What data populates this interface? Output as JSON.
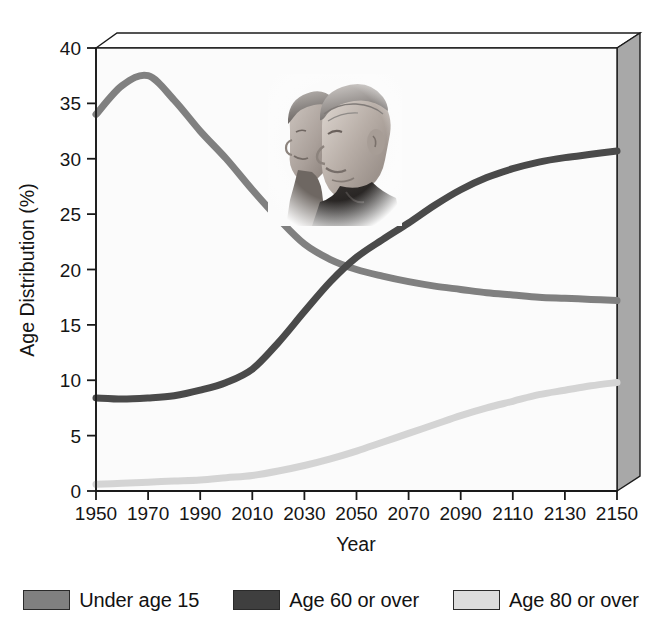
{
  "chart_data": {
    "type": "line",
    "title": "",
    "xlabel": "Year",
    "ylabel": "Age Distribution (%)",
    "xlim": [
      1950,
      2150
    ],
    "ylim": [
      0,
      40
    ],
    "xticks": [
      1950,
      1970,
      1990,
      2010,
      2030,
      2050,
      2070,
      2090,
      2110,
      2130,
      2150
    ],
    "yticks": [
      0,
      5,
      10,
      15,
      20,
      25,
      30,
      35,
      40
    ],
    "grid": false,
    "legend_position": "bottom",
    "style_note": "3-D walled plot box with shaded right side panel; inset grayscale photograph of an elderly couple",
    "x": [
      1950,
      1960,
      1970,
      1980,
      1990,
      2000,
      2010,
      2020,
      2030,
      2040,
      2050,
      2060,
      2070,
      2080,
      2090,
      2100,
      2110,
      2120,
      2130,
      2140,
      2150
    ],
    "series": [
      {
        "name": "Under age 15",
        "color": "#808080",
        "values": [
          34.0,
          36.6,
          37.5,
          35.3,
          32.5,
          30.0,
          27.2,
          24.6,
          22.3,
          20.9,
          20.0,
          19.4,
          18.9,
          18.5,
          18.2,
          17.9,
          17.7,
          17.5,
          17.4,
          17.3,
          17.2
        ]
      },
      {
        "name": "Age 60 or over",
        "color": "#4a4a4a",
        "values": [
          8.4,
          8.3,
          8.4,
          8.6,
          9.1,
          9.8,
          11.0,
          13.4,
          16.2,
          18.9,
          21.1,
          22.7,
          24.2,
          25.8,
          27.2,
          28.3,
          29.1,
          29.7,
          30.1,
          30.4,
          30.7
        ]
      },
      {
        "name": "Age 80 or over",
        "color": "#d4d4d4",
        "values": [
          0.6,
          0.7,
          0.8,
          0.9,
          1.0,
          1.2,
          1.4,
          1.8,
          2.3,
          2.9,
          3.6,
          4.4,
          5.2,
          6.0,
          6.8,
          7.5,
          8.1,
          8.7,
          9.1,
          9.5,
          9.8
        ]
      }
    ]
  },
  "axes": {
    "y_title": "Age Distribution (%)",
    "x_title": "Year",
    "x_tick_labels": [
      "1950",
      "1970",
      "1990",
      "2010",
      "2030",
      "2050",
      "2070",
      "2090",
      "2110",
      "2130",
      "2150"
    ],
    "y_tick_labels": [
      "0",
      "5",
      "10",
      "15",
      "20",
      "25",
      "30",
      "35",
      "40"
    ]
  },
  "legend": {
    "items": [
      {
        "label": "Under age 15",
        "color": "#808080"
      },
      {
        "label": "Age 60 or over",
        "color": "#3f3f3f"
      },
      {
        "label": "Age 80 or over",
        "color": "#dcdcdc"
      }
    ]
  },
  "colors": {
    "under15": "#808080",
    "age60": "#4a4a4a",
    "age80": "#d4d4d4",
    "panel_side": "#a8a8a8",
    "panel_top": "#ffffff",
    "plot_bg": "#fbfbfb",
    "axis": "#1a1a1a"
  }
}
